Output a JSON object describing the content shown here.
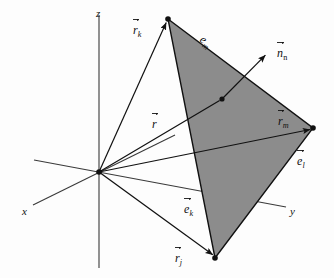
{
  "figure": {
    "background_color": "#fdfdfd",
    "line_color": "#1a1a1a",
    "panel_fill_color": "#8c8c8c",
    "panel_edge_color": "#111111",
    "axes": [
      {
        "id": "z",
        "label": "z",
        "label_x": 96,
        "label_y": 8
      },
      {
        "id": "x",
        "label": "x",
        "label_x": 22,
        "label_y": 206
      },
      {
        "id": "y",
        "label": "y",
        "label_x": 290,
        "label_y": 206
      }
    ],
    "vectors": [
      {
        "id": "r-k",
        "label_base": "r",
        "label_sub": "k",
        "arrow": true,
        "sub_upright": false,
        "label_x": 133,
        "label_y": 24
      },
      {
        "id": "r",
        "label_base": "r",
        "label_sub": "",
        "arrow": true,
        "sub_upright": false,
        "label_x": 152,
        "label_y": 118
      },
      {
        "id": "r-j",
        "label_base": "r",
        "label_sub": "j",
        "arrow": true,
        "sub_upright": false,
        "label_x": 175,
        "label_y": 252
      },
      {
        "id": "r-m",
        "label_base": "r",
        "label_sub": "m",
        "arrow": true,
        "sub_upright": false,
        "label_x": 278,
        "label_y": 115
      },
      {
        "id": "n-n",
        "label_base": "n",
        "label_sub": "n",
        "arrow": true,
        "sub_upright": true,
        "label_x": 277,
        "label_y": 47
      },
      {
        "id": "e-m",
        "label_base": "e",
        "label_sub": "m",
        "arrow": false,
        "sub_upright": false,
        "label_x": 205,
        "label_y": 33
      },
      {
        "id": "e-l",
        "label_base": "e",
        "label_sub": "l",
        "arrow": true,
        "sub_upright": false,
        "label_x": 297,
        "label_y": 155
      },
      {
        "id": "e-k",
        "label_base": "e",
        "label_sub": "k",
        "arrow": true,
        "sub_upright": false,
        "label_x": 184,
        "label_y": 203
      }
    ],
    "geometry": {
      "origin": {
        "x": 99,
        "y": 172
      },
      "vertex_k": {
        "x": 168,
        "y": 19
      },
      "vertex_m": {
        "x": 313,
        "y": 128
      },
      "vertex_j": {
        "x": 215,
        "y": 258
      },
      "centroid_point": {
        "x": 222,
        "y": 99
      },
      "normal_tip": {
        "x": 267,
        "y": 53
      },
      "z_axis_top": {
        "x": 99,
        "y": 15
      },
      "z_axis_bottom": {
        "x": 99,
        "y": 268
      },
      "x_axis_end": {
        "x": 33,
        "y": 205
      },
      "x_axis_far": {
        "x": 175,
        "y": 135
      },
      "y_axis_end": {
        "x": 286,
        "y": 207
      },
      "y_axis_far": {
        "x": 34,
        "y": 160
      }
    }
  }
}
